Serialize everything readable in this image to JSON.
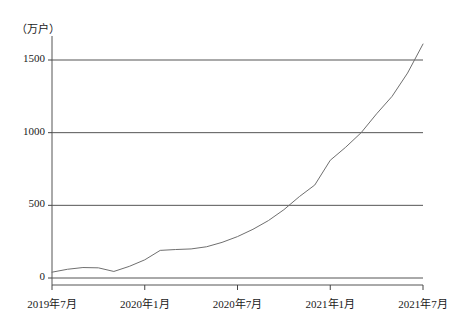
{
  "chart_data": {
    "type": "line",
    "title": "",
    "subtitle": "",
    "xlabel": "",
    "ylabel": "",
    "unit_label": "（万户）",
    "grid": true,
    "legend": null,
    "ylim": [
      0,
      1700
    ],
    "yticks": [
      0,
      500,
      1000,
      1500
    ],
    "ytick_labels": [
      "0",
      "500",
      "1000",
      "1500"
    ],
    "xtick_labels": [
      "2019年7月",
      "2020年1月",
      "2020年7月",
      "2021年1月",
      "2021年7月"
    ],
    "xtick_indices": [
      0,
      6,
      12,
      18,
      24
    ],
    "x": [
      "2019年7月",
      "2019年8月",
      "2019年9月",
      "2019年10月",
      "2019年11月",
      "2019年12月",
      "2020年1月",
      "2020年2月",
      "2020年3月",
      "2020年4月",
      "2020年5月",
      "2020年6月",
      "2020年7月",
      "2020年8月",
      "2020年9月",
      "2020年10月",
      "2020年11月",
      "2020年12月",
      "2021年1月",
      "2021年2月",
      "2021年3月",
      "2021年4月",
      "2021年5月",
      "2021年6月",
      "2021年7月"
    ],
    "values": [
      40,
      60,
      72,
      70,
      45,
      80,
      125,
      190,
      196,
      200,
      215,
      245,
      285,
      335,
      395,
      470,
      560,
      640,
      810,
      900,
      1000,
      1130,
      1250,
      1410,
      1610
    ],
    "series": [
      {
        "name": "5G套餐用户数",
        "color": "#6b6b6b",
        "values": [
          40,
          60,
          72,
          70,
          45,
          80,
          125,
          190,
          196,
          200,
          215,
          245,
          285,
          335,
          395,
          470,
          560,
          640,
          810,
          900,
          1000,
          1130,
          1250,
          1410,
          1610
        ]
      }
    ],
    "colors": {
      "line": "#6f6f6f",
      "grid": "#555555",
      "axis": "#444444",
      "text": "#1a1a1a",
      "background": "#ffffff"
    }
  },
  "geometry": {
    "plot_left": 52,
    "plot_right": 423,
    "y_zero": 278,
    "y_top_value_px": 36,
    "px_per_unit": 0.14533
  }
}
